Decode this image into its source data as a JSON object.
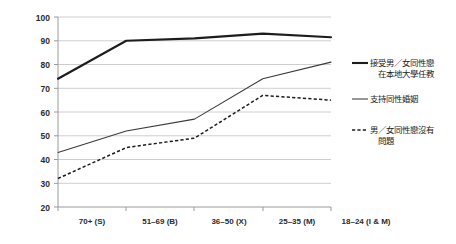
{
  "chart_data": {
    "type": "line",
    "title": "",
    "subtitle": "",
    "xlabel": "",
    "ylabel": "",
    "ylim": [
      20,
      100
    ],
    "ytick_step": 10,
    "yticks": [
      "100",
      "90",
      "80",
      "70",
      "60",
      "50",
      "40",
      "30",
      "20"
    ],
    "grid": "horizontal",
    "legend_position": "right",
    "categories": [
      "70+ (S)",
      "51–69 (B)",
      "36–50 (X)",
      "25–35 (M)",
      "18–24 (I & M)"
    ],
    "series": [
      {
        "name": "接受男／女同性戀在本地大學任教",
        "style": "thick-solid",
        "color": "#1d1d1d",
        "values": [
          74,
          90,
          91,
          93,
          91.5
        ]
      },
      {
        "name": "支持同性婚姻",
        "style": "thin-solid",
        "color": "#3a3a3a",
        "values": [
          43,
          52,
          57,
          74,
          81
        ]
      },
      {
        "name": "男／女同性戀沒有問題",
        "style": "dashed",
        "color": "#1d1d1d",
        "values": [
          32,
          45,
          49,
          67,
          65
        ]
      }
    ]
  },
  "legend": {
    "items": [
      {
        "line1": "接受男／女同性戀",
        "line2": "在本地大學任教"
      },
      {
        "line1": "支持同性婚姻",
        "line2": ""
      },
      {
        "line1": "男／女同性戀沒有",
        "line2": "問題"
      }
    ]
  }
}
